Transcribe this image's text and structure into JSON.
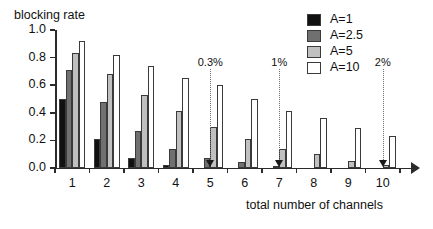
{
  "chart_data": {
    "type": "bar",
    "title": "",
    "ylabel": "blocking rate",
    "xlabel": "total number of channels",
    "categories": [
      "1",
      "2",
      "3",
      "4",
      "5",
      "6",
      "7",
      "8",
      "9",
      "10"
    ],
    "ylim": [
      0.0,
      1.0
    ],
    "yticks": [
      "0.0",
      "0.2",
      "0.4",
      "0.6",
      "0.8",
      "1.0"
    ],
    "ytick_values": [
      0.0,
      0.2,
      0.4,
      0.6,
      0.8,
      1.0
    ],
    "grid": false,
    "legend_position": "top-right",
    "series": [
      {
        "name": "A=1",
        "color": "#111111",
        "values": [
          0.5,
          0.21,
          0.07,
          0.02,
          0.005,
          0.0,
          0.0,
          0.0,
          0.0,
          0.0
        ]
      },
      {
        "name": "A=2.5",
        "color": "#707070",
        "values": [
          0.71,
          0.48,
          0.27,
          0.14,
          0.07,
          0.04,
          0.015,
          0.0,
          0.0,
          0.0
        ]
      },
      {
        "name": "A=5",
        "color": "#c0c0c0",
        "values": [
          0.83,
          0.68,
          0.53,
          0.41,
          0.3,
          0.21,
          0.14,
          0.1,
          0.05,
          0.02
        ]
      },
      {
        "name": "A=10",
        "color": "#ffffff",
        "values": [
          0.92,
          0.82,
          0.74,
          0.65,
          0.6,
          0.5,
          0.41,
          0.36,
          0.29,
          0.23
        ]
      }
    ],
    "annotations": [
      {
        "label": "0.3%",
        "at_category": "4.5"
      },
      {
        "label": "1%",
        "at_category": "6.5"
      },
      {
        "label": "2%",
        "at_category": "9.5"
      }
    ]
  },
  "legend": {
    "entries": [
      {
        "label": "A=1"
      },
      {
        "label": "A=2.5"
      },
      {
        "label": "A=5"
      },
      {
        "label": "A=10"
      }
    ]
  }
}
